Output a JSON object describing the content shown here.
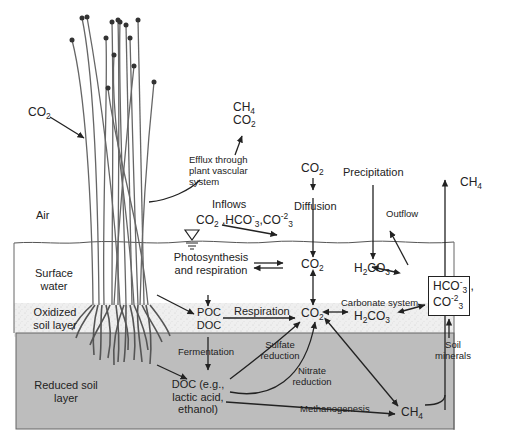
{
  "zones": {
    "air": "Air",
    "surface_water": [
      "Surface",
      "water"
    ],
    "oxidized": [
      "Oxidized",
      "soil layer"
    ],
    "reduced": [
      "Reduced soil",
      "layer"
    ]
  },
  "labels": {
    "co2_uptake": "CO",
    "efflux_ch4": "CH",
    "efflux_co2": "CO",
    "efflux_text": [
      "Efflux through",
      "plant vascular",
      "system"
    ],
    "inflows_title": "Inflows",
    "inflows_species": [
      "CO",
      "HCO",
      "CO"
    ],
    "diffusion": "Diffusion",
    "co2_air": "CO",
    "precipitation": "Precipitation",
    "ch4_top": "CH",
    "outflow": "Outflow",
    "photosynthesis": [
      "Photosynthesis",
      "and respiration"
    ],
    "co2_water": "CO",
    "h2co3_water": "CO",
    "poc": "POC",
    "doc": "DOC",
    "respiration": "Respiration",
    "co2_soil": "CO",
    "carbonate_system": "Carbonate system",
    "h2co3_soil": "CO",
    "box_hco3": "HCO",
    "box_co3": "CO",
    "fermentation": "Fermentation",
    "sulfate_reduction": [
      "Sulfate",
      "reduction"
    ],
    "nitrate_reduction": [
      "Nitrate",
      "reduction"
    ],
    "soil_minerals": [
      "Soil",
      "minerals"
    ],
    "doc_products": [
      "DOC (e.g.,",
      "lactic acid,",
      "ethanol)"
    ],
    "methanogenesis": "Methanogenesis",
    "ch4_soil": "CH"
  },
  "subs": {
    "two": "2",
    "three": "3",
    "four": "4",
    "minus": "-",
    "minus2": "-2",
    "h2": "H"
  },
  "colors": {
    "reduced_soil": "#bdbdbd",
    "oxidized_soil": "#ececec",
    "ink": "#222222",
    "plant": "#555555"
  }
}
